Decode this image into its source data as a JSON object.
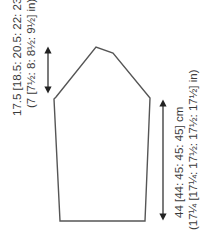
{
  "diagram": {
    "type": "sleeve-schematic",
    "colors": {
      "line": "#555555",
      "text": "#3a3a3a",
      "background": "#ffffff"
    },
    "cap_height": {
      "metric": "17.5 [18.5: 20.5: 22: 23.5] cm",
      "imperial": "(7 [7½: 8: 8½: 9½] in)"
    },
    "sleeve_length": {
      "metric": "44 [44: 45: 45: 45] cm",
      "imperial": "(17¼ [17¼: 17½: 17½: 17½] in)"
    }
  }
}
